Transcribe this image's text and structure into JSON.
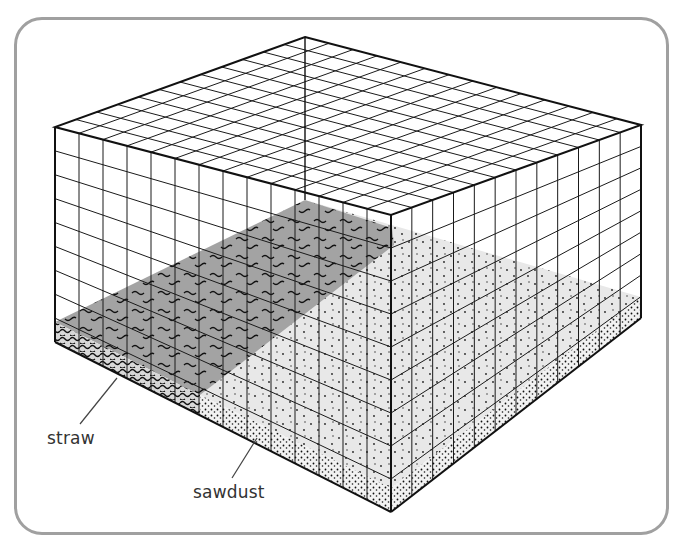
{
  "figure": {
    "labels": {
      "straw": "straw",
      "sawdust": "sawdust"
    },
    "colors": {
      "frame_border": "#a0a0a0",
      "grid_line": "#1a1a1a",
      "straw_fill": "#9e9e9e",
      "sawdust_fill": "#e6e6e6",
      "background": "#ffffff"
    }
  }
}
